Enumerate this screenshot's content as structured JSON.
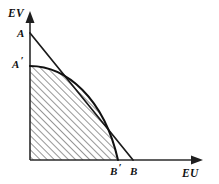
{
  "figure": {
    "type": "economics-diagram",
    "background_color": "#ffffff",
    "ink_color": "#111111"
  },
  "axes": {
    "vertical": {
      "label": "EV",
      "label_position": {
        "x": 8,
        "y": 17
      },
      "origin": {
        "x": 30,
        "y": 160
      },
      "tip": {
        "x": 30,
        "y": 13
      },
      "arrow": "up-arrow-icon"
    },
    "horizontal": {
      "label": "EU",
      "label_position": {
        "x": 182,
        "y": 177
      },
      "origin": {
        "x": 30,
        "y": 160
      },
      "tip": {
        "x": 203,
        "y": 160
      },
      "arrow": "right-arrow-icon"
    }
  },
  "points": [
    {
      "id": "A",
      "label": "A",
      "prime": "",
      "label_position": {
        "x": 17,
        "y": 37
      },
      "coords": {
        "x": 30,
        "y": 33
      },
      "meaning": "vertical intercept of the straight grand utility line"
    },
    {
      "id": "A-prime",
      "label": "A",
      "prime": "′",
      "label_position": {
        "x": 12,
        "y": 68
      },
      "coords": {
        "x": 30,
        "y": 66
      },
      "meaning": "vertical intercept of the bowed utility possibility frontier"
    },
    {
      "id": "B-prime",
      "label": "B",
      "prime": "′",
      "label_position": {
        "x": 110,
        "y": 175
      },
      "coords": {
        "x": 118,
        "y": 160
      },
      "meaning": "horizontal intercept of the bowed utility possibility frontier"
    },
    {
      "id": "B",
      "label": "B",
      "prime": "",
      "label_position": {
        "x": 130,
        "y": 175
      },
      "coords": {
        "x": 133,
        "y": 160
      },
      "meaning": "horizontal intercept of the straight grand utility line"
    }
  ],
  "curves": {
    "straight_line": {
      "name": "grand-utility-line",
      "from": {
        "x": 30,
        "y": 33
      },
      "to": {
        "x": 133,
        "y": 160
      },
      "path": "M 30 33 L 133 160"
    },
    "frontier": {
      "name": "utility-possibility-frontier",
      "from": {
        "x": 30,
        "y": 66
      },
      "to": {
        "x": 118,
        "y": 160
      },
      "path": "M 30 66 C 66 66 104 98 118 160"
    }
  },
  "shaded_region": {
    "name": "attainable-utility-set",
    "fill_style": "diagonal-hatch",
    "hatch_angle_degrees": 45,
    "hatch_spacing_px": 5,
    "path": "M 30 66 C 66 66 104 98 118 160 L 30 160 Z"
  }
}
